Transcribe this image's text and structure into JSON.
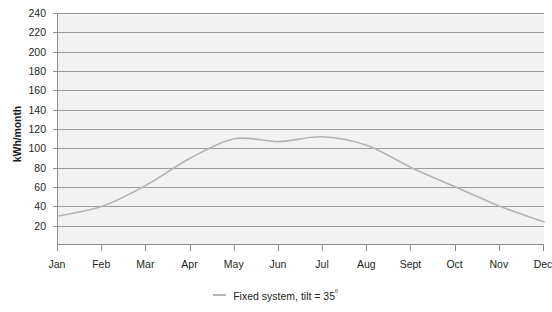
{
  "chart_data": {
    "type": "line",
    "title": "",
    "xlabel": "",
    "ylabel": "kWh/month",
    "categories": [
      "Jan",
      "Feb",
      "Mar",
      "Apr",
      "May",
      "Jun",
      "Jul",
      "Aug",
      "Sept",
      "Oct",
      "Nov",
      "Dec"
    ],
    "series": [
      {
        "name": "Fixed system, tilt = 35º",
        "values": [
          30,
          40,
          62,
          90,
          110,
          107,
          112,
          103,
          80,
          60,
          40,
          24
        ],
        "color": "#b3b3b3"
      }
    ],
    "ylim": [
      0,
      240
    ],
    "yticks": [
      20,
      40,
      60,
      80,
      100,
      120,
      140,
      160,
      180,
      200,
      220,
      240
    ],
    "ytick_labels": [
      "20",
      "40",
      "60",
      "80",
      "100",
      "120",
      "140",
      "160",
      "180",
      "200",
      "220",
      "240"
    ],
    "grid": true,
    "grid_axis": "y",
    "legend_position": "bottom",
    "legend_entries": [
      {
        "label_text": "Fixed system, tilt = 35",
        "label_sup": "º",
        "marker": "line",
        "color": "#b3b3b3"
      }
    ],
    "plot_background": "#f2f2f2",
    "gridline_color": "#9b9b9b",
    "axis_color": "#8c8c8c",
    "text_color": "#231f20"
  }
}
